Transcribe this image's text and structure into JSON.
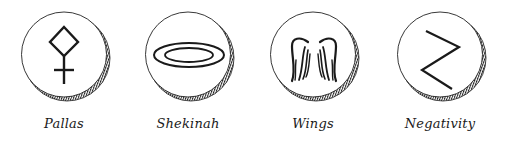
{
  "symbols": [
    {
      "name": "Pallas",
      "icon": "pallas-icon"
    },
    {
      "name": "Shekinah",
      "icon": "shekinah-icon"
    },
    {
      "name": "Wings",
      "icon": "wings-icon"
    },
    {
      "name": "Negativity",
      "icon": "negativity-icon"
    }
  ],
  "colors": {
    "ink": "#1a1a1a",
    "background": "#ffffff"
  }
}
